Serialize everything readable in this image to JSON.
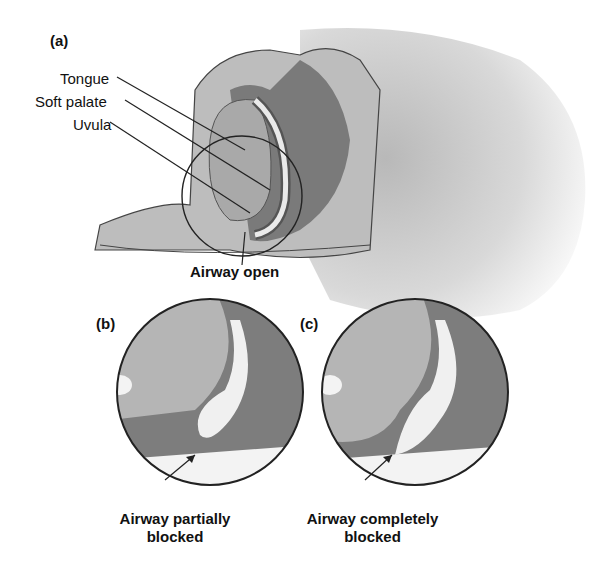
{
  "panels": {
    "a": {
      "tag": "(a)",
      "labels": [
        "Tongue",
        "Soft palate",
        "Uvula"
      ],
      "caption": "Airway open"
    },
    "b": {
      "tag": "(b)",
      "caption_line1": "Airway partially",
      "caption_line2": "blocked"
    },
    "c": {
      "tag": "(c)",
      "caption_line1": "Airway completely",
      "caption_line2": "blocked"
    }
  },
  "colors": {
    "tissue_light": "#b8b8b8",
    "tissue_dark": "#7a7a7a",
    "airway": "#efefef",
    "outline": "#222222"
  }
}
